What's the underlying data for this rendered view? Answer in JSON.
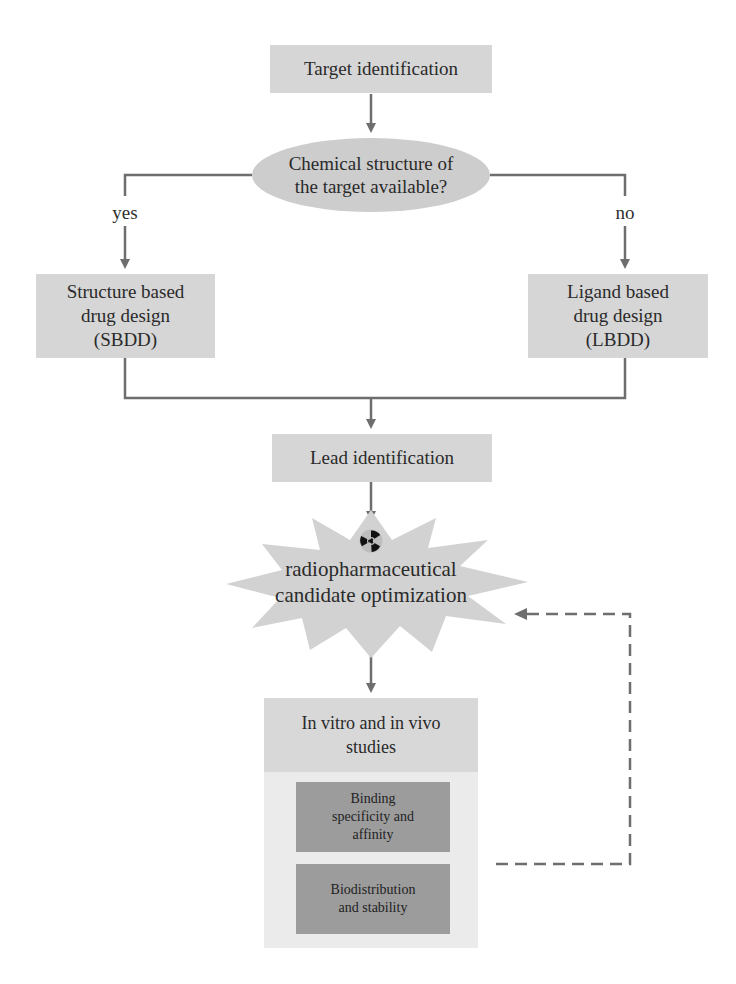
{
  "diagram": {
    "nodes": {
      "target": {
        "label": "Target identification"
      },
      "decision": {
        "label_line1": "Chemical structure of",
        "label_line2": "the target available?"
      },
      "sbdd": {
        "line1": "Structure based",
        "line2": "drug design",
        "line3": "(SBDD)"
      },
      "lbdd": {
        "line1": "Ligand based",
        "line2": "drug design",
        "line3": "(LBDD)"
      },
      "lead": {
        "label": "Lead identification"
      },
      "optimization": {
        "line1": "radiopharmaceutical",
        "line2": "candidate optimization",
        "icon": "radiation-icon"
      },
      "studies": {
        "header_line1": "In vitro and in vivo",
        "header_line2": "studies",
        "items": [
          {
            "line1": "Binding",
            "line2": "specificity and",
            "line3": "affinity"
          },
          {
            "line1": "Biodistribution",
            "line2": "and stability"
          }
        ]
      }
    },
    "edge_labels": {
      "yes": "yes",
      "no": "no"
    },
    "colors": {
      "box_fill": "#d6d6d6",
      "ellipse_fill": "#cdcdcd",
      "burst_fill": "#d2d2d2",
      "container_fill": "#ebebeb",
      "dark_box_fill": "#9c9c9c",
      "line": "#6e6e6e"
    }
  }
}
